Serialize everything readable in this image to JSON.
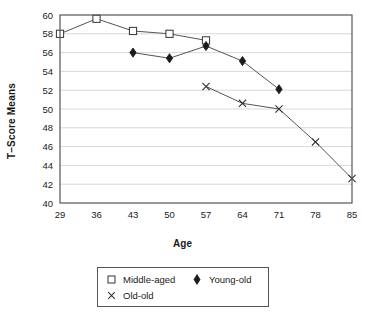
{
  "chart_data": {
    "type": "line",
    "title": "",
    "xlabel": "Age",
    "ylabel": "T–Score Means",
    "x": [
      29,
      36,
      43,
      50,
      57,
      64,
      71,
      78,
      85
    ],
    "xticklabels": [
      "29",
      "36",
      "43",
      "50",
      "57",
      "64",
      "71",
      "78",
      "85"
    ],
    "yticklabels": [
      "40",
      "42",
      "44",
      "46",
      "48",
      "50",
      "52",
      "54",
      "56",
      "58",
      "60"
    ],
    "yticks": [
      40,
      42,
      44,
      46,
      48,
      50,
      52,
      54,
      56,
      58,
      60
    ],
    "ylim": [
      40,
      60
    ],
    "grid": "horizontal",
    "legend_position": "below-plot",
    "series": [
      {
        "name": "Middle-aged",
        "marker": "open-square",
        "color": "#333333",
        "points": [
          {
            "x": 29,
            "y": 58.0
          },
          {
            "x": 36,
            "y": 59.6
          },
          {
            "x": 43,
            "y": 58.3
          },
          {
            "x": 50,
            "y": 58.0
          },
          {
            "x": 57,
            "y": 57.3
          }
        ]
      },
      {
        "name": "Young-old",
        "marker": "filled-diamond",
        "color": "#1a1a1a",
        "points": [
          {
            "x": 43,
            "y": 56.0
          },
          {
            "x": 50,
            "y": 55.4
          },
          {
            "x": 57,
            "y": 56.7
          },
          {
            "x": 64,
            "y": 55.1
          },
          {
            "x": 71,
            "y": 52.1
          }
        ]
      },
      {
        "name": "Old-old",
        "marker": "cross-x",
        "color": "#333333",
        "points": [
          {
            "x": 57,
            "y": 52.4
          },
          {
            "x": 64,
            "y": 50.6
          },
          {
            "x": 71,
            "y": 50.0
          },
          {
            "x": 78,
            "y": 46.5
          },
          {
            "x": 85,
            "y": 42.6
          }
        ]
      }
    ]
  },
  "legend": {
    "items": [
      {
        "label": "Middle-aged",
        "marker": "open-square"
      },
      {
        "label": "Old-old",
        "marker": "cross-x"
      },
      {
        "label": "Young-old",
        "marker": "filled-diamond"
      }
    ]
  },
  "colors": {
    "axis": "#555555",
    "gridline": "#d8d8d8",
    "line": "#555555",
    "marker_stroke": "#333333",
    "marker_fill_open": "#ffffff",
    "marker_fill_solid": "#1a1a1a",
    "text": "#1a1a1a",
    "background": "#ffffff"
  }
}
